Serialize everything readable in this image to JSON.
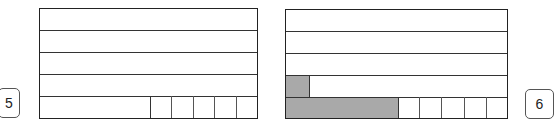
{
  "diagrams": [
    {
      "label": "5",
      "rows": 5,
      "bottom_row_cells": 5,
      "shaded_cells": []
    },
    {
      "label": "6",
      "rows": 5,
      "bottom_row_cells": 5,
      "shaded_cells": [
        "row-4-small-cell",
        "row-5-large-part"
      ]
    }
  ],
  "colors": {
    "shade": "#a9a9a9",
    "border": "#222222"
  }
}
